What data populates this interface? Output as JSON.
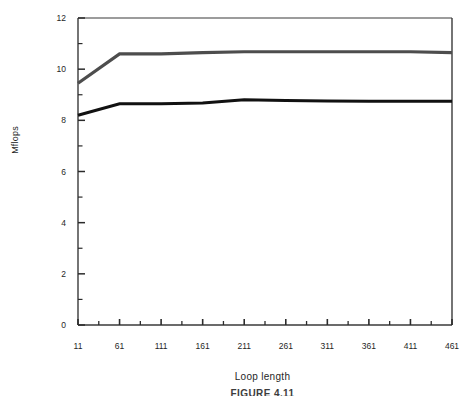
{
  "chart_data": {
    "type": "line",
    "title": "",
    "subtitle": "",
    "xlabel": "Loop length",
    "ylabel": "Mflops",
    "xlim": [
      11,
      461
    ],
    "ylim": [
      0,
      12
    ],
    "grid": false,
    "legend": "none",
    "x": [
      11,
      61,
      111,
      161,
      211,
      261,
      311,
      361,
      411,
      461
    ],
    "xticks": [
      "11",
      "61",
      "111",
      "161",
      "211",
      "261",
      "311",
      "361",
      "411",
      "461"
    ],
    "xminor_ticks": [
      36,
      86,
      136,
      186,
      236,
      286,
      336,
      386,
      436
    ],
    "yticks": [
      "0",
      "2",
      "4",
      "6",
      "8",
      "10",
      "12"
    ],
    "ytick_values": [
      0,
      2,
      4,
      6,
      8,
      10,
      12
    ],
    "yminor_ticks": [
      1,
      3,
      5,
      7,
      9,
      11
    ],
    "series": [
      {
        "name": "upper-curve",
        "color": "#4d4d4d",
        "linewidth": 3.2,
        "values": [
          9.45,
          10.6,
          10.6,
          10.65,
          10.68,
          10.68,
          10.68,
          10.68,
          10.68,
          10.65
        ]
      },
      {
        "name": "lower-curve",
        "color": "#111111",
        "linewidth": 3.0,
        "values": [
          8.2,
          8.65,
          8.65,
          8.68,
          8.8,
          8.78,
          8.76,
          8.75,
          8.75,
          8.75
        ]
      }
    ]
  },
  "axes": {
    "frame_color": "#3a3a3a",
    "background": "#ffffff"
  },
  "caption": {
    "text": "FIGURE 4.11"
  }
}
